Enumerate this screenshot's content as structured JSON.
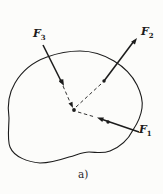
{
  "figure": {
    "caption": "a)",
    "forces": [
      {
        "name": "F",
        "subscript": "1"
      },
      {
        "name": "F",
        "subscript": "2"
      },
      {
        "name": "F",
        "subscript": "3"
      }
    ],
    "colors": {
      "ink": "#1c1c1c",
      "background": "#fcfcfa"
    }
  }
}
